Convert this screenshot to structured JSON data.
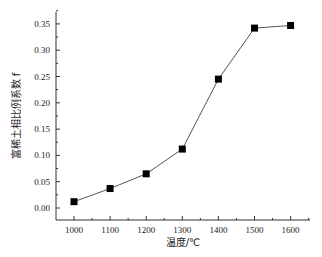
{
  "chart_data": {
    "type": "line",
    "title": "",
    "xlabel": "温度/℃",
    "ylabel": "富稀土相比例系数 f",
    "x": [
      1000,
      1100,
      1200,
      1300,
      1400,
      1500,
      1600
    ],
    "series": [
      {
        "name": "富稀土相比例系数",
        "values": [
          0.012,
          0.037,
          0.065,
          0.112,
          0.245,
          0.342,
          0.347
        ],
        "marker": "square",
        "color": "#000000",
        "line_color": "#555555"
      }
    ],
    "xticks": [
      "1000",
      "1100",
      "1200",
      "1300",
      "1400",
      "1500",
      "1600"
    ],
    "yticks": [
      "0.00",
      "0.05",
      "0.10",
      "0.15",
      "0.20",
      "0.25",
      "0.30",
      "0.35"
    ],
    "xlim": [
      950,
      1650
    ],
    "ylim": [
      -0.02,
      0.38
    ],
    "grid": false,
    "legend": null
  }
}
